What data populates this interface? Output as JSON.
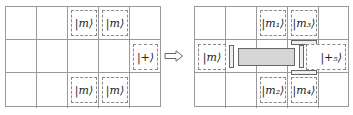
{
  "left_grid": {
    "rows": 3,
    "cols": 5,
    "kets": [
      {
        "label": "|m⟩",
        "row": 0,
        "col": 2
      },
      {
        "label": "|m⟩",
        "row": 0,
        "col": 3
      },
      {
        "label": "|+⟩",
        "row": 1,
        "col": 4
      },
      {
        "label": "|m⟩",
        "row": 2,
        "col": 2
      },
      {
        "label": "|m⟩",
        "row": 2,
        "col": 3
      }
    ]
  },
  "arrow": {
    "icon": "double-right-arrow-icon",
    "symbol": "⟹"
  },
  "right_grid": {
    "rows": 3,
    "cols": 5,
    "kets": [
      {
        "label": "|m₁⟩",
        "row": 0,
        "col": 2
      },
      {
        "label": "|m₃⟩",
        "row": 0,
        "col": 3
      },
      {
        "label": "|m⟩",
        "row": 1,
        "col": 1
      },
      {
        "label": "|+₅⟩",
        "row": 1,
        "col": 4
      },
      {
        "label": "|m₂⟩",
        "row": 2,
        "col": 2
      },
      {
        "label": "|m₄⟩",
        "row": 2,
        "col": 3
      }
    ],
    "colors": {
      "patch_fill": "#d6d6d6",
      "patch_border": "#555555"
    }
  }
}
